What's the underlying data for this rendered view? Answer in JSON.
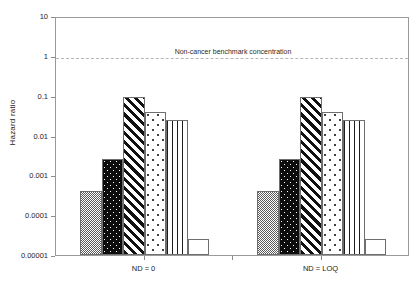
{
  "chart_data": {
    "type": "bar",
    "title": "",
    "xlabel": "",
    "ylabel": "Hazard ratio",
    "yscale": "log",
    "ylim": [
      1e-05,
      10
    ],
    "ytick_labels": [
      "10",
      "1",
      "0.1",
      "0.01",
      "0.001",
      "0.0001",
      "0.00001"
    ],
    "ytick_values": [
      10,
      1,
      0.1,
      0.01,
      0.001,
      0.0001,
      1e-05
    ],
    "grid": false,
    "legend": "none",
    "categories": [
      "ND = 0",
      "ND = LOQ"
    ],
    "series": [
      {
        "name": "series-1",
        "pattern": "fine-dots",
        "values": [
          0.0004,
          0.0004
        ]
      },
      {
        "name": "series-2",
        "pattern": "black-dots",
        "values": [
          0.0025,
          0.0025
        ]
      },
      {
        "name": "series-3",
        "pattern": "diagonal",
        "values": [
          0.095,
          0.095
        ]
      },
      {
        "name": "series-4",
        "pattern": "sparse-dots",
        "values": [
          0.04,
          0.04
        ]
      },
      {
        "name": "series-5",
        "pattern": "vertical",
        "values": [
          0.024,
          0.024
        ]
      },
      {
        "name": "series-6",
        "pattern": "plain",
        "values": [
          2.5e-05,
          2.5e-05
        ]
      }
    ],
    "annotations": [
      {
        "name": "non-cancer-benchmark",
        "text": "Non-cancer benchmark concentration",
        "value": 1,
        "style": "dashed-horizontal-line"
      }
    ]
  },
  "axis": {
    "y_title": "Hazard ratio",
    "ticks": [
      {
        "label": "10"
      },
      {
        "label": "1"
      },
      {
        "label": "0.1"
      },
      {
        "label": "0.01"
      },
      {
        "label": "0.001"
      },
      {
        "label": "0.0001"
      },
      {
        "label": "0.00001"
      }
    ]
  },
  "groups": [
    {
      "label": "ND = 0"
    },
    {
      "label": "ND = LOQ"
    }
  ],
  "benchmark": {
    "label": "Non-cancer benchmark concentration"
  },
  "colors": {
    "frame": "#9a9a9a",
    "bar_edge": "#6e6e6e",
    "benchmark_line": "#b5b5b5",
    "text": "#222222",
    "background": "#ffffff"
  }
}
